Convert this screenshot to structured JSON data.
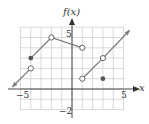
{
  "chart_data": {
    "type": "line",
    "title": "",
    "xlabel": "x",
    "ylabel": "f(x)",
    "xlim": [
      -5,
      5
    ],
    "ylim": [
      -2,
      6
    ],
    "grid": true,
    "tick_labels": {
      "x": [
        "-5",
        "5"
      ],
      "y": [
        "5",
        "-2"
      ]
    },
    "series": [
      {
        "name": "piece-1",
        "points": [
          [
            -5.8,
            0.2
          ],
          [
            -4,
            2
          ]
        ],
        "start": "arrow",
        "end": "open"
      },
      {
        "name": "piece-2",
        "points": [
          [
            -4,
            3
          ],
          [
            -2,
            5
          ],
          [
            1,
            4
          ]
        ],
        "start": "closed",
        "mid": "open",
        "end": "open"
      },
      {
        "name": "piece-3",
        "points": [
          [
            1,
            1
          ],
          [
            3,
            3
          ],
          [
            5.6,
            5.7
          ]
        ],
        "start": "open",
        "mid": "open",
        "end": "arrow"
      }
    ],
    "isolated_points": [
      {
        "x": 3,
        "y": 1,
        "style": "closed"
      }
    ],
    "colors": {
      "curve": "#7a7a7a",
      "grid": "#c8c8c8",
      "axis": "#333333"
    }
  },
  "labels": {
    "y_axis": "f(x)",
    "x_axis": "x",
    "x_neg5": "−5",
    "x_pos5": "5",
    "y_pos5": "5",
    "y_neg2": "−2"
  }
}
